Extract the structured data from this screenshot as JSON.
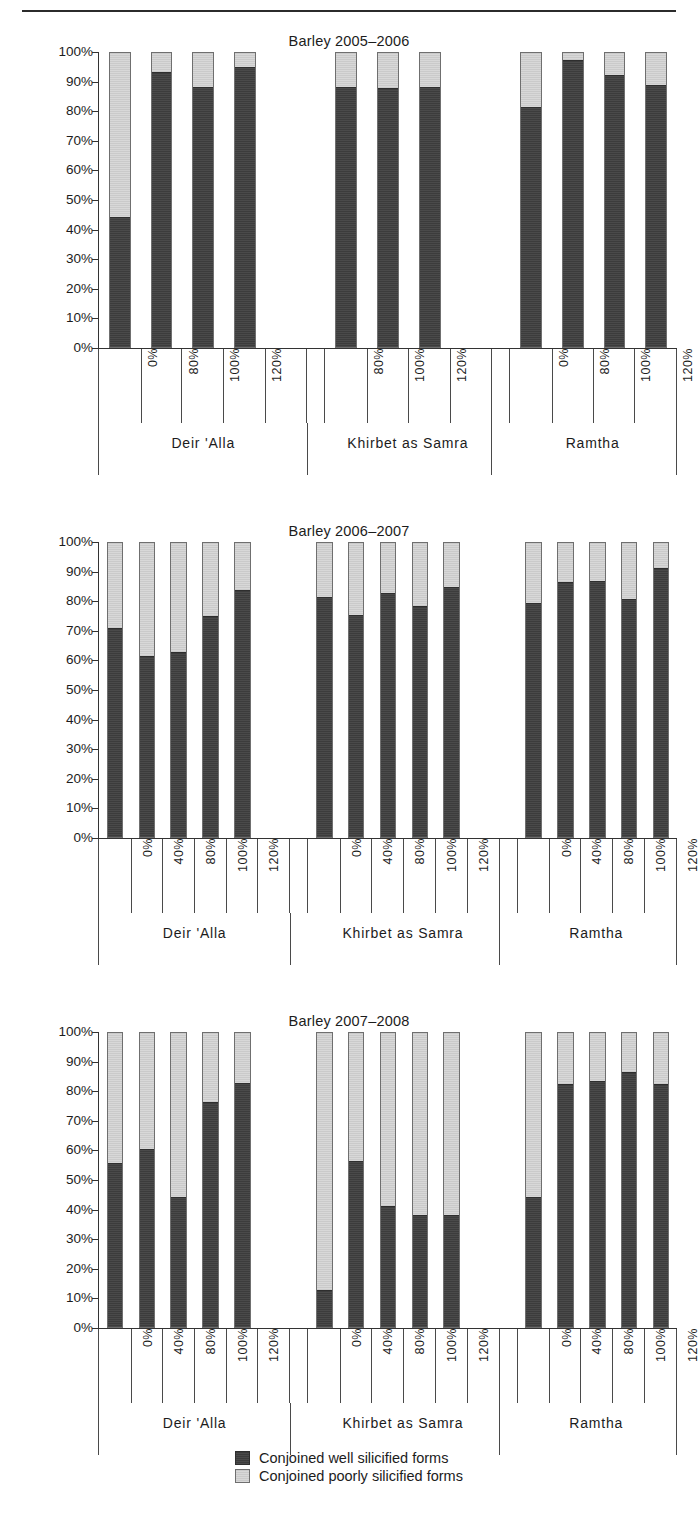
{
  "page": {
    "top_rule": true
  },
  "legend": {
    "items": [
      {
        "key": "dark",
        "label": "Conjoined well silicified forms",
        "color": "#434343"
      },
      {
        "key": "light",
        "label": "Conjoined poorly silicified forms",
        "color": "#d3d3d3"
      }
    ]
  },
  "axis": {
    "yticks": [
      "100%",
      "90%",
      "80%",
      "70%",
      "60%",
      "50%",
      "40%",
      "30%",
      "20%",
      "10%",
      "0%"
    ]
  },
  "chart_data": [
    {
      "type": "bar",
      "title": "Barley 2005–2006",
      "xlabel": "",
      "ylabel": "",
      "ylim": [
        0,
        100
      ],
      "grid": false,
      "stacked": true,
      "legend_position": "bottom",
      "series": [
        {
          "name": "Conjoined well silicified forms",
          "color": "#434343"
        },
        {
          "name": "Conjoined poorly silicified forms",
          "color": "#d3d3d3"
        }
      ],
      "groups": [
        {
          "name": "Deir 'Alla",
          "slots": 5,
          "categories": [
            "0%",
            "80%",
            "100%",
            "120%",
            ""
          ],
          "well": [
            44,
            93,
            88,
            94.5,
            null
          ],
          "poorly": [
            56,
            7,
            12,
            5.5,
            null
          ]
        },
        {
          "name": "Khirbet as Samra",
          "slots": 4,
          "categories": [
            "80%",
            "100%",
            "120%",
            ""
          ],
          "well": [
            88,
            87.5,
            88,
            null
          ],
          "poorly": [
            12,
            12.5,
            12,
            null
          ]
        },
        {
          "name": "Ramtha",
          "slots": 4,
          "categories": [
            "0%",
            "80%",
            "100%",
            "120%"
          ],
          "well": [
            81,
            97,
            92,
            88.5
          ],
          "poorly": [
            19,
            3,
            8,
            11.5
          ]
        }
      ]
    },
    {
      "type": "bar",
      "title": "Barley 2006–2007",
      "xlabel": "",
      "ylabel": "",
      "ylim": [
        0,
        100
      ],
      "grid": false,
      "stacked": true,
      "legend_position": "bottom",
      "series": [
        {
          "name": "Conjoined well silicified forms",
          "color": "#434343"
        },
        {
          "name": "Conjoined poorly silicified forms",
          "color": "#d3d3d3"
        }
      ],
      "groups": [
        {
          "name": "Deir 'Alla",
          "slots": 6,
          "categories": [
            "0%",
            "40%",
            "80%",
            "100%",
            "120%",
            ""
          ],
          "well": [
            70.5,
            61,
            62.5,
            74.5,
            83.5,
            null
          ],
          "poorly": [
            29.5,
            39,
            37.5,
            25.5,
            16.5,
            null
          ]
        },
        {
          "name": "Khirbet as Samra",
          "slots": 6,
          "categories": [
            "0%",
            "40%",
            "80%",
            "100%",
            "120%",
            ""
          ],
          "well": [
            81,
            75,
            82.5,
            78,
            84.5,
            null
          ],
          "poorly": [
            19,
            25,
            17.5,
            22,
            15.5,
            null
          ]
        },
        {
          "name": "Ramtha",
          "slots": 5,
          "categories": [
            "0%",
            "40%",
            "80%",
            "100%",
            "120%"
          ],
          "well": [
            79,
            86,
            86.5,
            80.5,
            91
          ],
          "poorly": [
            21,
            14,
            13.5,
            19.5,
            9
          ]
        }
      ]
    },
    {
      "type": "bar",
      "title": "Barley 2007–2008",
      "xlabel": "",
      "ylabel": "",
      "ylim": [
        0,
        100
      ],
      "grid": false,
      "stacked": true,
      "legend_position": "bottom",
      "series": [
        {
          "name": "Conjoined well silicified forms",
          "color": "#434343"
        },
        {
          "name": "Conjoined poorly silicified forms",
          "color": "#d3d3d3"
        }
      ],
      "groups": [
        {
          "name": "Deir 'Alla",
          "slots": 6,
          "categories": [
            "0%",
            "40%",
            "80%",
            "100%",
            "120%",
            ""
          ],
          "well": [
            55.5,
            60,
            44,
            76,
            82.5,
            null
          ],
          "poorly": [
            44.5,
            40,
            56,
            24,
            17.5,
            null
          ]
        },
        {
          "name": "Khirbet as Samra",
          "slots": 6,
          "categories": [
            "0%",
            "40%",
            "80%",
            "100%",
            "120%",
            ""
          ],
          "well": [
            12.5,
            56,
            41,
            38,
            38,
            null
          ],
          "poorly": [
            87.5,
            44,
            59,
            62,
            62,
            null
          ]
        },
        {
          "name": "Ramtha",
          "slots": 5,
          "categories": [
            "0%",
            "40%",
            "80%",
            "100%",
            "120%"
          ],
          "well": [
            44,
            82,
            83,
            86,
            82
          ],
          "poorly": [
            56,
            18,
            17,
            14,
            18
          ]
        }
      ]
    }
  ]
}
